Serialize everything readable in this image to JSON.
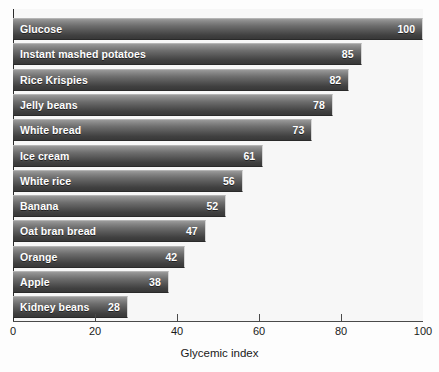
{
  "chart_data": {
    "type": "bar",
    "orientation": "horizontal",
    "title": "",
    "xlabel": "Glycemic index",
    "ylabel": "",
    "xlim": [
      0,
      100
    ],
    "xticks": [
      0,
      20,
      40,
      60,
      80,
      100
    ],
    "grid": false,
    "legend": null,
    "value_labels_shown": true,
    "categories": [
      "Glucose",
      "Instant mashed potatoes",
      "Rice Krispies",
      "Jelly beans",
      "White bread",
      "Ice cream",
      "White rice",
      "Banana",
      "Oat bran bread",
      "Orange",
      "Apple",
      "Kidney beans"
    ],
    "values": [
      100,
      85,
      82,
      78,
      73,
      61,
      56,
      52,
      47,
      42,
      38,
      28
    ],
    "bars": [
      {
        "label": "Glucose",
        "value": 100
      },
      {
        "label": "Instant mashed potatoes",
        "value": 85
      },
      {
        "label": "Rice Krispies",
        "value": 82
      },
      {
        "label": "Jelly beans",
        "value": 78
      },
      {
        "label": "White bread",
        "value": 73
      },
      {
        "label": "Ice cream",
        "value": 61
      },
      {
        "label": "White rice",
        "value": 56
      },
      {
        "label": "Banana",
        "value": 52
      },
      {
        "label": "Oat bran bread",
        "value": 47
      },
      {
        "label": "Orange",
        "value": 42
      },
      {
        "label": "Apple",
        "value": 38
      },
      {
        "label": "Kidney beans",
        "value": 28
      }
    ],
    "colors": {
      "bar_top": "#9a9a9a",
      "bar_bottom": "#383838",
      "plot_background": "#f7f7f7",
      "axis": "#2b2b2b",
      "label_text": "#ffffff",
      "tick_text": "#1a1a1a"
    }
  }
}
